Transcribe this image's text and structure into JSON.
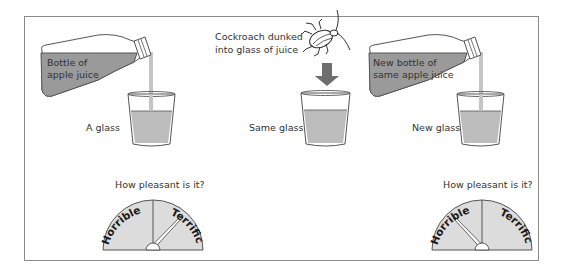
{
  "figure": {
    "frame_color": "#8a8a8a",
    "juice_color": "#bcbcbc",
    "bottle_fill": "#9a9a9a",
    "panels": [
      {
        "id": "left",
        "bottle_label_line1": "Bottle of",
        "bottle_label_line2": "apple juice",
        "glass_label": "A glass",
        "gauge": {
          "question": "How pleasant is it?",
          "left_label": "Horrible",
          "right_label": "Terrific",
          "needle_reading": "Terrific (pointing right, ~45°)"
        }
      },
      {
        "id": "middle",
        "caption_line1": "Cockroach dunked",
        "caption_line2": "into glass of juice",
        "glass_label": "Same glass",
        "icon": "cockroach-icon",
        "arrow": "down-arrow-icon"
      },
      {
        "id": "right",
        "bottle_label_line1": "New bottle of",
        "bottle_label_line2": "same apple juice",
        "glass_label": "New glass",
        "gauge": {
          "question": "How pleasant is it?",
          "left_label": "Horrible",
          "right_label": "Terrific",
          "needle_reading": "Horrible (pointing left, ~135°)"
        }
      }
    ]
  }
}
